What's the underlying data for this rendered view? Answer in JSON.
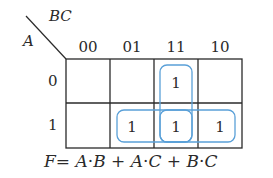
{
  "kmap": {
    "row_var": "A",
    "col_var": "BC",
    "col_headers": [
      "00",
      "01",
      "11",
      "10"
    ],
    "row_headers": [
      "0",
      "1"
    ],
    "cells": [
      [
        "",
        "",
        "1",
        ""
      ],
      [
        "",
        "1",
        "1",
        "1"
      ]
    ],
    "groups": [
      {
        "term": "B·C",
        "cells": [
          [
            0,
            2
          ],
          [
            1,
            2
          ]
        ],
        "orientation": "vertical"
      },
      {
        "term": "A·C",
        "cells": [
          [
            1,
            1
          ],
          [
            1,
            2
          ]
        ],
        "orientation": "horizontal"
      },
      {
        "term": "A·B",
        "cells": [
          [
            1,
            2
          ],
          [
            1,
            3
          ]
        ],
        "orientation": "horizontal"
      }
    ],
    "loop_color": "#5aa0d8",
    "grid_color": "#2a2a2a"
  },
  "formula": {
    "lhs": "F",
    "eq": "=",
    "t1a": "A",
    "t1dot": "·",
    "t1b": "B",
    "plus1": "+",
    "t2a": "A",
    "t2dot": "·",
    "t2b": "C",
    "plus2": "+",
    "t3a": "B",
    "t3dot": "·",
    "t3b": "C"
  }
}
